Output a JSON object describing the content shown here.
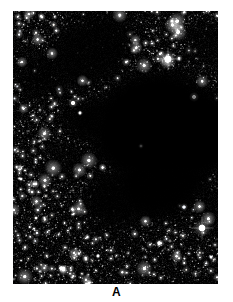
{
  "figure": {
    "domain": "natural-image",
    "background_color": "#ffffff",
    "panel": {
      "label": "A",
      "x": 13,
      "y": 11,
      "width": 205,
      "height": 273,
      "background_color": "#000000",
      "description": "Dense Milky Way star field with a large opaque dark nebula (starless absorption cloud) across the centre and right"
    },
    "palette": {
      "sky_black": "#000000",
      "star_white": "#ffffff",
      "star_warm": "#fff2dd",
      "star_cool": "#dce8ff",
      "faint_grain": "#2a2a2a",
      "label_color": "#000000",
      "page_white": "#ffffff"
    },
    "sky": {
      "star_count_faint": 3400,
      "star_count_mid": 520,
      "star_count_bright": 46,
      "random_seed": 20240517,
      "grain_opacity": 0.55,
      "bright_stars": [
        {
          "name": "bright-star-1",
          "x": 155,
          "y": 48,
          "radius": 3.1,
          "color": "#ffffff",
          "glow": 9,
          "spikes": true
        },
        {
          "name": "bright-star-2",
          "x": 189,
          "y": 217,
          "radius": 3.0,
          "color": "#ffffff",
          "glow": 9,
          "spikes": true
        },
        {
          "name": "bright-star-3",
          "x": 60,
          "y": 92,
          "radius": 1.9,
          "color": "#fff2dd",
          "glow": 5,
          "spikes": false
        },
        {
          "name": "bright-star-4",
          "x": 181,
          "y": 86,
          "radius": 1.7,
          "color": "#ffffff",
          "glow": 5,
          "spikes": false
        },
        {
          "name": "bright-star-5",
          "x": 171,
          "y": 196,
          "radius": 1.6,
          "color": "#dce8ff",
          "glow": 4,
          "spikes": false
        },
        {
          "name": "bright-star-6",
          "x": 48,
          "y": 257,
          "radius": 1.6,
          "color": "#ffffff",
          "glow": 4,
          "spikes": false
        },
        {
          "name": "bright-star-7",
          "x": 146,
          "y": 232,
          "radius": 1.5,
          "color": "#ffffff",
          "glow": 4,
          "spikes": false
        },
        {
          "name": "bright-star-8",
          "x": 210,
          "y": 74,
          "radius": 1.5,
          "color": "#fff2dd",
          "glow": 4,
          "spikes": false
        },
        {
          "name": "bright-star-9",
          "x": 85,
          "y": 245,
          "radius": 1.4,
          "color": "#ffffff",
          "glow": 3,
          "spikes": false
        },
        {
          "name": "bright-star-10",
          "x": 97,
          "y": 278,
          "radius": 1.5,
          "color": "#ffffff",
          "glow": 4,
          "spikes": false
        },
        {
          "name": "bright-star-11",
          "x": 198,
          "y": 246,
          "radius": 1.3,
          "color": "#dce8ff",
          "glow": 3,
          "spikes": false
        },
        {
          "name": "bright-star-12",
          "x": 8,
          "y": 168,
          "radius": 1.3,
          "color": "#ffffff",
          "glow": 3,
          "spikes": false
        },
        {
          "name": "bright-star-13",
          "x": 23,
          "y": 207,
          "radius": 1.3,
          "color": "#fff2dd",
          "glow": 3,
          "spikes": false
        },
        {
          "name": "bright-star-14",
          "x": 128,
          "y": 135,
          "radius": 1.3,
          "color": "#ffffff",
          "glow": 3,
          "spikes": false
        },
        {
          "name": "bright-star-15",
          "x": 67,
          "y": 102,
          "radius": 1.4,
          "color": "#ffffff",
          "glow": 3,
          "spikes": false
        }
      ],
      "dark_clouds": [
        {
          "name": "main-nebula-core",
          "cx": 140,
          "cy": 115,
          "rx": 62,
          "ry": 52,
          "rot": -18,
          "strength": 1.0,
          "blur": 16
        },
        {
          "name": "nebula-right-lobe",
          "cx": 178,
          "cy": 122,
          "rx": 42,
          "ry": 46,
          "rot": 10,
          "strength": 1.0,
          "blur": 14
        },
        {
          "name": "nebula-lower-lobe",
          "cx": 148,
          "cy": 168,
          "rx": 50,
          "ry": 36,
          "rot": -25,
          "strength": 0.95,
          "blur": 18
        },
        {
          "name": "nebula-tail",
          "cx": 105,
          "cy": 185,
          "rx": 34,
          "ry": 26,
          "rot": -40,
          "strength": 0.8,
          "blur": 18
        },
        {
          "name": "nebula-left-arm",
          "cx": 92,
          "cy": 108,
          "rx": 38,
          "ry": 20,
          "rot": -8,
          "strength": 0.85,
          "blur": 16
        },
        {
          "name": "upper-dark-lane",
          "cx": 78,
          "cy": 40,
          "rx": 46,
          "ry": 30,
          "rot": -30,
          "strength": 0.7,
          "blur": 20
        },
        {
          "name": "upper-left-patch",
          "cx": 30,
          "cy": 66,
          "rx": 26,
          "ry": 22,
          "rot": 15,
          "strength": 0.6,
          "blur": 18
        },
        {
          "name": "top-right-haze",
          "cx": 196,
          "cy": 34,
          "rx": 24,
          "ry": 18,
          "rot": 0,
          "strength": 0.45,
          "blur": 16
        },
        {
          "name": "mid-left-wisp",
          "cx": 52,
          "cy": 150,
          "rx": 24,
          "ry": 16,
          "rot": -20,
          "strength": 0.4,
          "blur": 16
        },
        {
          "name": "bottom-right-wisp",
          "cx": 200,
          "cy": 196,
          "rx": 22,
          "ry": 20,
          "rot": 0,
          "strength": 0.45,
          "blur": 16
        }
      ]
    }
  }
}
